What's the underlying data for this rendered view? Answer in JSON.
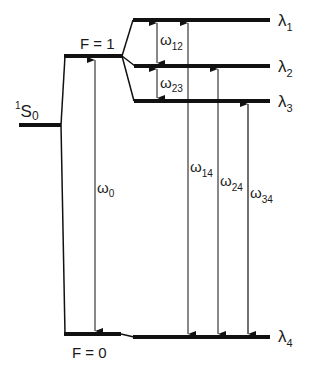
{
  "diagram": {
    "type": "energy-level-diagram",
    "levels": {
      "ground_state": {
        "label": "S",
        "superscript": "1",
        "subscript": "0"
      },
      "f1": {
        "label": "F = 1"
      },
      "f0": {
        "label": "F = 0"
      },
      "lambda1": {
        "label": "λ",
        "subscript": "1"
      },
      "lambda2": {
        "label": "λ",
        "subscript": "2"
      },
      "lambda3": {
        "label": "λ",
        "subscript": "3"
      },
      "lambda4": {
        "label": "λ",
        "subscript": "4"
      }
    },
    "transitions": {
      "w0": {
        "label": "ω",
        "subscript": "0"
      },
      "w12": {
        "label": "ω",
        "subscript": "12"
      },
      "w23": {
        "label": "ω",
        "subscript": "23"
      },
      "w14": {
        "label": "ω",
        "subscript": "14"
      },
      "w24": {
        "label": "ω",
        "subscript": "24"
      },
      "w34": {
        "label": "ω",
        "subscript": "34"
      }
    },
    "colors": {
      "line": "#111111",
      "background": "#ffffff"
    }
  }
}
